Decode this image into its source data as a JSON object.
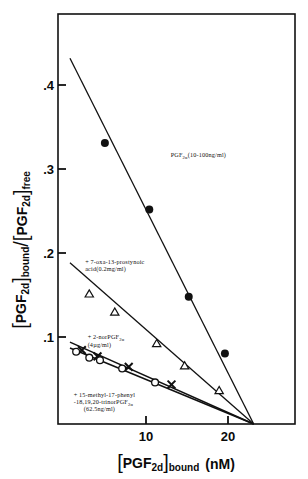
{
  "figure": {
    "kind": "scatchard-plot"
  },
  "axes": {
    "y_title_parts": {
      "bracket_open_1": "[",
      "pgf_1": "PGF",
      "sub_1": "2d",
      "bracket_close_1": "]",
      "bound": "bound",
      "slash": "/",
      "bracket_open_2": "[",
      "pgf_2": "PGF",
      "sub_2": "2d",
      "bracket_close_2": "]",
      "free": "free"
    },
    "x_title_parts": {
      "bracket_open": "[",
      "pgf": "PGF",
      "sub": "2d",
      "bracket_close": "]",
      "bound": "bound",
      "units": "(nM)"
    },
    "y_ticks": [
      ".1",
      ".2",
      ".3",
      ".4"
    ],
    "x_ticks": [
      "10",
      "20"
    ]
  },
  "chart_data": {
    "type": "scatter",
    "title": "",
    "subtitle": "",
    "xlabel": "[PGF2d]bound (nM)",
    "ylabel": "[PGF2d]bound / [PGF2d]free",
    "xlim": [
      0,
      28.5
    ],
    "ylim": [
      0,
      0.485
    ],
    "xticks": [
      10,
      20
    ],
    "yticks": [
      0.1,
      0.2,
      0.3,
      0.4
    ],
    "grid": false,
    "legend": "inline annotations next to each line",
    "series": [
      {
        "name": "PGF2α (10-100ng/ml)",
        "marker": "filled-circle",
        "label": "PGF",
        "label_sub": "2α",
        "label_tail": "(10-100ng/ml)",
        "label_x": 13.0,
        "label_y": 0.318,
        "line": {
          "x0": 0.75,
          "y0": 0.4355,
          "x1": 23.1,
          "y1": 0.0
        },
        "points": [
          {
            "x": 5.0,
            "y": 0.3345
          },
          {
            "x": 10.4,
            "y": 0.2555
          },
          {
            "x": 15.2,
            "y": 0.1515
          },
          {
            "x": 19.6,
            "y": 0.084
          }
        ]
      },
      {
        "name": "+ 7-oxa-13-prostynoic acid(0.2mg/ml)",
        "marker": "open-triangle",
        "label_line1": "+ 7-oxa-13-prostynoic",
        "label_line2": "acid(0.2mg/ml)",
        "label_x": 2.6,
        "label_y": 0.1905,
        "line": {
          "x0": 0.75,
          "y0": 0.192,
          "x1": 23.1,
          "y1": 0.0
        },
        "points": [
          {
            "x": 3.1,
            "y": 0.155
          },
          {
            "x": 6.2,
            "y": 0.1335
          },
          {
            "x": 11.3,
            "y": 0.096
          },
          {
            "x": 14.7,
            "y": 0.0695
          },
          {
            "x": 18.9,
            "y": 0.04
          }
        ]
      },
      {
        "name": "+ 2-norPGF2α (4µg/ml)",
        "marker": "cross-x",
        "label_line1": "+ 2-norPGF",
        "label_sub": "2α",
        "label_line2": "(4µg/ml)",
        "label_x": 2.9,
        "label_y": 0.101,
        "line": {
          "x0": 0.75,
          "y0": 0.0975,
          "x1": 23.1,
          "y1": 0.0
        },
        "points": [
          {
            "x": 2.2,
            "y": 0.088
          },
          {
            "x": 4.1,
            "y": 0.0805
          },
          {
            "x": 7.9,
            "y": 0.068
          },
          {
            "x": 13.1,
            "y": 0.047
          }
        ]
      },
      {
        "name": "+ 15-methyl-17-phenyl-18,19,20-trinorPGF2α (62.5ng/ml)",
        "marker": "open-circle",
        "label_line1": "+ 15-methyl-17-phenyl",
        "label_line2": "-18,19,20-trinorPGF",
        "label_sub": "2α",
        "label_line3": "(62.5ng/ml)",
        "label_x": 1.2,
        "label_y": 0.0325,
        "line": {
          "x0": 0.75,
          "y0": 0.0905,
          "x1": 23.1,
          "y1": 0.0
        },
        "points": [
          {
            "x": 1.5,
            "y": 0.086
          },
          {
            "x": 3.1,
            "y": 0.079
          },
          {
            "x": 4.4,
            "y": 0.076
          },
          {
            "x": 7.1,
            "y": 0.066
          },
          {
            "x": 11.1,
            "y": 0.0495
          }
        ]
      }
    ]
  }
}
